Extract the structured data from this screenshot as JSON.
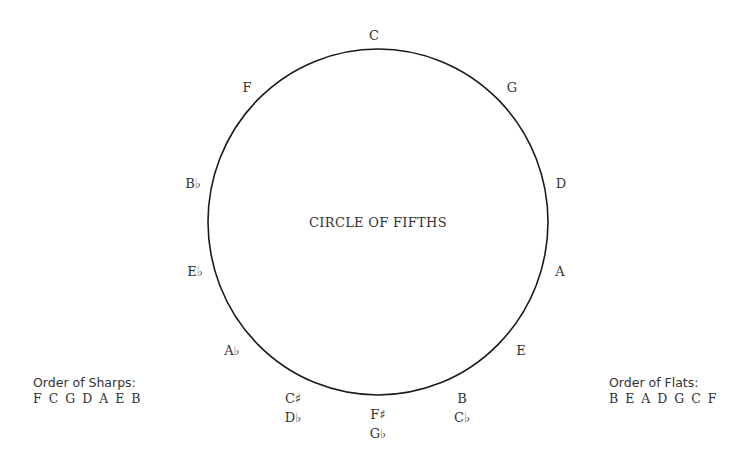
{
  "diagram": {
    "title": "CIRCLE OF FIFTHS",
    "circle": {
      "cx": 378,
      "cy": 222,
      "rx": 170,
      "ry": 173,
      "stroke": "#1a1a1a"
    },
    "notes": [
      {
        "id": "c",
        "lines": [
          "C"
        ],
        "x": 374,
        "y": 35
      },
      {
        "id": "g",
        "lines": [
          "G"
        ],
        "x": 512,
        "y": 87
      },
      {
        "id": "d",
        "lines": [
          "D"
        ],
        "x": 561,
        "y": 183
      },
      {
        "id": "a",
        "lines": [
          "A"
        ],
        "x": 560,
        "y": 271
      },
      {
        "id": "e",
        "lines": [
          "E"
        ],
        "x": 521,
        "y": 350
      },
      {
        "id": "b-cflat",
        "lines": [
          "B",
          "C♭"
        ],
        "x": 462,
        "y": 408
      },
      {
        "id": "fsharp-gflat",
        "lines": [
          "F♯",
          "G♭"
        ],
        "x": 378,
        "y": 424
      },
      {
        "id": "csharp-dflat",
        "lines": [
          "C♯",
          "D♭"
        ],
        "x": 293,
        "y": 408
      },
      {
        "id": "aflat",
        "lines": [
          "A♭"
        ],
        "x": 232,
        "y": 350
      },
      {
        "id": "eflat",
        "lines": [
          "E♭"
        ],
        "x": 195,
        "y": 271
      },
      {
        "id": "bflat",
        "lines": [
          "B♭"
        ],
        "x": 193,
        "y": 183
      },
      {
        "id": "f",
        "lines": [
          "F"
        ],
        "x": 247,
        "y": 87
      }
    ],
    "order_of_sharps": {
      "label": "Order of Sharps:",
      "sequence": "F C G D A E B"
    },
    "order_of_flats": {
      "label": "Order of Flats:",
      "sequence": "B E A D G C F"
    }
  }
}
